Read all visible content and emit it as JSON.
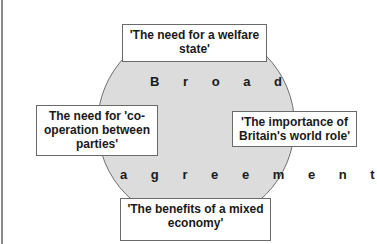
{
  "diagram": {
    "center_label": {
      "top_word": "B r o a d",
      "bottom_word": "a g r e e m e n t",
      "full_text": "Broad agreement"
    },
    "boxes": {
      "top": "'The need for a welfare state'",
      "left": "The need for 'co-operation between parties'",
      "right": "'The importance of Britain's world role'",
      "bottom": "'The benefits of a mixed economy'"
    },
    "colors": {
      "circle_fill": "#dcdcdc",
      "circle_stroke": "#6f6f6f",
      "box_fill": "#ffffff",
      "box_stroke": "#6a6a6a",
      "text": "#1a1a1a",
      "left_rule": "#8a8a8a"
    }
  }
}
